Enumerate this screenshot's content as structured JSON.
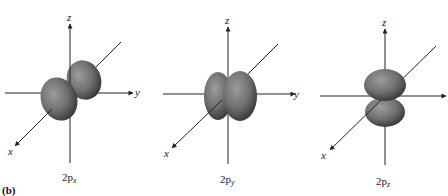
{
  "figure": {
    "panel_letter": "(b)",
    "colors": {
      "lobe_highlight": "#9a9a9a",
      "lobe_mid": "#6e6e6e",
      "lobe_edge": "#333333",
      "axis": "#222222",
      "background": "#ffffff"
    },
    "orbitals": [
      {
        "id": "2px",
        "caption_main": "2p",
        "caption_sub": "x",
        "axis_labels": {
          "x": "x",
          "y": "y",
          "z": "z"
        }
      },
      {
        "id": "2py",
        "caption_main": "2p",
        "caption_sub": "y",
        "axis_labels": {
          "x": "x",
          "y": "y",
          "z": "z"
        }
      },
      {
        "id": "2pz",
        "caption_main": "2p",
        "caption_sub": "z",
        "axis_labels": {
          "x": "x",
          "y": "",
          "z": "z"
        }
      }
    ]
  }
}
